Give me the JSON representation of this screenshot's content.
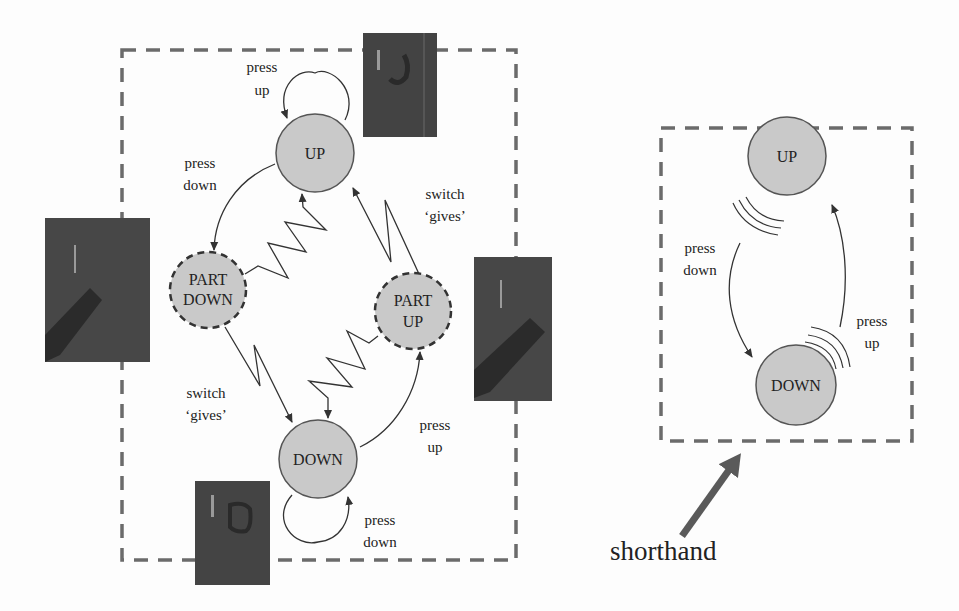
{
  "colors": {
    "node_fill": "#c9c9c9",
    "node_stroke": "#555555",
    "dash_box": "#6b6b6b",
    "photo_bg": "#3f3f3f",
    "arrow_big": "#5a5a5a",
    "text": "#222222"
  },
  "full_diagram": {
    "nodes": {
      "up": "UP",
      "part_down_1": "PART",
      "part_down_2": "DOWN",
      "part_up_1": "PART",
      "part_up_2": "UP",
      "down": "DOWN"
    },
    "labels": {
      "up_self_1": "press",
      "up_self_2": "up",
      "up_to_partdown_1": "press",
      "up_to_partdown_2": "down",
      "partup_to_up_1": "switch",
      "partup_to_up_2": "‘gives’",
      "partdown_to_down_1": "switch",
      "partdown_to_down_2": "‘gives’",
      "down_to_partup_1": "press",
      "down_to_partup_2": "up",
      "down_self_1": "press",
      "down_self_2": "down"
    },
    "photos": [
      "switch-up-photo",
      "switch-part-down-photo",
      "switch-part-up-photo",
      "switch-down-photo"
    ]
  },
  "shorthand_diagram": {
    "nodes": {
      "up": "UP",
      "down": "DOWN"
    },
    "labels": {
      "press_down_1": "press",
      "press_down_2": "down",
      "press_up_1": "press",
      "press_up_2": "up"
    }
  },
  "caption": {
    "shorthand": "shorthand"
  }
}
